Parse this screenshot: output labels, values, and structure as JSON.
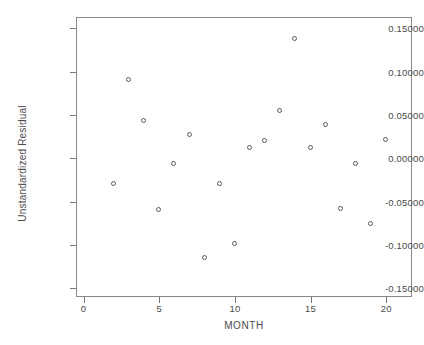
{
  "chart_data": {
    "type": "scatter",
    "title": "",
    "xlabel": "MONTH",
    "ylabel": "Unstandardized Residual",
    "xlim": [
      -0.5,
      21.7
    ],
    "ylim": [
      -0.16,
      0.163
    ],
    "grid": false,
    "legend": "none",
    "marker": "open-circle",
    "xticks": [
      "0",
      "5",
      "10",
      "15",
      "20"
    ],
    "xtick_values": [
      0,
      5,
      10,
      15,
      20
    ],
    "yticks": [
      "0.15000",
      "0.10000",
      "0.05000",
      "0.00000",
      "-0.05000",
      "-0.10000",
      "-0.15000"
    ],
    "ytick_values": [
      0.15,
      0.1,
      0.05,
      0.0,
      -0.05,
      -0.1,
      -0.15
    ],
    "x": [
      2,
      3,
      4,
      5,
      6,
      7,
      8,
      9,
      10,
      11,
      12,
      13,
      14,
      15,
      16,
      17,
      18,
      19,
      20
    ],
    "y": [
      -0.03,
      0.09,
      0.043,
      -0.06,
      -0.006,
      0.027,
      -0.115,
      -0.03,
      -0.099,
      0.012,
      0.02,
      0.055,
      0.138,
      0.012,
      0.038,
      -0.058,
      -0.006,
      -0.076,
      0.021
    ],
    "points": [
      {
        "x": 2,
        "y": -0.03
      },
      {
        "x": 3,
        "y": 0.09
      },
      {
        "x": 4,
        "y": 0.043
      },
      {
        "x": 5,
        "y": -0.06
      },
      {
        "x": 6,
        "y": -0.006
      },
      {
        "x": 7,
        "y": 0.027
      },
      {
        "x": 8,
        "y": -0.115
      },
      {
        "x": 9,
        "y": -0.03
      },
      {
        "x": 10,
        "y": -0.099
      },
      {
        "x": 11,
        "y": 0.012
      },
      {
        "x": 12,
        "y": 0.02
      },
      {
        "x": 13,
        "y": 0.055
      },
      {
        "x": 14,
        "y": 0.138
      },
      {
        "x": 15,
        "y": 0.012
      },
      {
        "x": 16,
        "y": 0.038
      },
      {
        "x": 17,
        "y": -0.058
      },
      {
        "x": 18,
        "y": -0.006
      },
      {
        "x": 19,
        "y": -0.076
      },
      {
        "x": 20,
        "y": 0.021
      }
    ]
  },
  "colors": {
    "marker_stroke": "#5a5a5a",
    "frame": "#8a8a8a",
    "text": "#4a4a4a",
    "background": "#ffffff"
  }
}
